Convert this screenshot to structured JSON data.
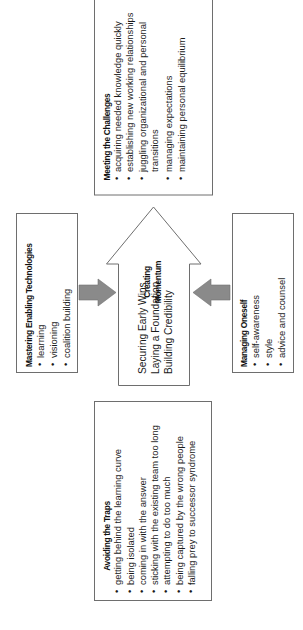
{
  "diagram": {
    "orientation": "rotated -90deg (text reads bottom-to-top)",
    "center": {
      "title": "Creating Momentum",
      "title_line1": "Creating",
      "title_line2": "Momentum",
      "lines": [
        "Securing Early Wins",
        "Laying a Foundation",
        "Building Credibility"
      ]
    },
    "challenges": {
      "title": "Meeting the Challenges",
      "items": [
        "acquiring needed knowledge quickly",
        "establishing new working relationships",
        "juggling organizational and personal",
        "transitions",
        "managing expectations",
        "maintaining personal equilibrium"
      ]
    },
    "technologies": {
      "title": "Mastering Enabling Technologies",
      "items": [
        "learning",
        "visioning",
        "coalition building"
      ]
    },
    "oneself": {
      "title": "Managing Oneself",
      "items": [
        "self-awareness",
        "style",
        "advice and counsel"
      ]
    },
    "traps": {
      "title": "Avoiding the Traps",
      "items": [
        "getting behind the learning curve",
        "being isolated",
        "coming in with the answer",
        "sticking with the existing team too long",
        "attempting to do too much",
        "being captured by the wrong people",
        "falling prey to successor syndrome"
      ]
    },
    "bullet": "•",
    "colors": {
      "box_border": "#6e6e6e",
      "gray_arrow": "#8a8a8a",
      "text": "#1a1a1a"
    }
  }
}
